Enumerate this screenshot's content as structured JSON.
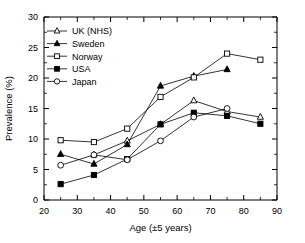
{
  "chart_data": {
    "type": "line",
    "title": "",
    "xlabel": "Age (±5 years)",
    "ylabel": "Prevalence (%)",
    "xlim": [
      20,
      90
    ],
    "ylim": [
      0,
      30
    ],
    "xticks": [
      20,
      30,
      40,
      50,
      60,
      70,
      80,
      90
    ],
    "yticks": [
      0,
      5,
      10,
      15,
      20,
      25,
      30
    ],
    "xtick_labels": [
      "20",
      "30",
      "40",
      "50",
      "60",
      "70",
      "80",
      "90"
    ],
    "ytick_labels": [
      "0",
      "5",
      "10",
      "15",
      "20",
      "25",
      "30"
    ],
    "minor_xticks": [
      25,
      35,
      45,
      55,
      65,
      75,
      85
    ],
    "minor_yticks": [
      2.5,
      7.5,
      12.5,
      17.5,
      22.5,
      27.5
    ],
    "grid": false,
    "legend_position": "upper left",
    "x": [
      25,
      35,
      45,
      55,
      65,
      75,
      85
    ],
    "series": [
      {
        "name": "UK (NHS)",
        "marker": "open-triangle",
        "color": "#000000",
        "x": [
          35,
          45,
          55,
          65,
          75,
          85
        ],
        "values": [
          7.4,
          9.7,
          12.4,
          16.3,
          14.5,
          13.6
        ]
      },
      {
        "name": "Sweden",
        "marker": "filled-triangle",
        "color": "#000000",
        "x": [
          25,
          35,
          45,
          55,
          65,
          75
        ],
        "values": [
          7.5,
          5.9,
          9.1,
          18.7,
          20.3,
          21.4
        ]
      },
      {
        "name": "Norway",
        "marker": "open-square",
        "color": "#000000",
        "x": [
          25,
          35,
          45,
          55,
          65,
          75,
          85
        ],
        "values": [
          9.8,
          9.5,
          11.7,
          16.9,
          20.1,
          24.0,
          23.0
        ]
      },
      {
        "name": "USA",
        "marker": "filled-square",
        "color": "#000000",
        "x": [
          25,
          35,
          45,
          55,
          65,
          75,
          85
        ],
        "values": [
          2.6,
          4.1,
          6.7,
          12.4,
          14.3,
          13.8,
          12.5
        ]
      },
      {
        "name": "Japan",
        "marker": "open-circle",
        "color": "#000000",
        "x": [
          25,
          35,
          45,
          55,
          65,
          75
        ],
        "values": [
          5.7,
          7.4,
          6.6,
          9.7,
          13.6,
          15.0
        ]
      }
    ]
  },
  "legend": {
    "items": [
      {
        "label": "UK (NHS)"
      },
      {
        "label": "Sweden"
      },
      {
        "label": "Norway"
      },
      {
        "label": "USA"
      },
      {
        "label": "Japan"
      }
    ]
  }
}
